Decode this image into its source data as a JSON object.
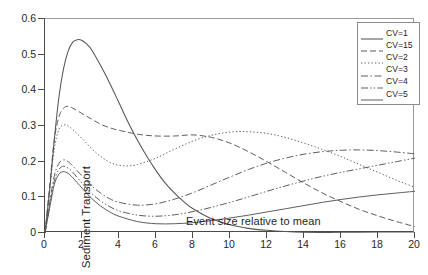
{
  "chart_data": {
    "type": "line",
    "title": "",
    "xlabel": "Event  size relative to mean",
    "ylabel": "Sediment Transport",
    "xlim": [
      0,
      20
    ],
    "ylim": [
      0,
      0.6
    ],
    "xticks": [
      0,
      2,
      4,
      6,
      8,
      10,
      12,
      14,
      16,
      18,
      20
    ],
    "yticks": [
      "0",
      "0.1",
      "0.2",
      "0.3",
      "0.4",
      "0.5",
      "0.6"
    ],
    "grid": false,
    "legend_position": "top-right",
    "series": [
      {
        "name": "CV=1",
        "style": "solid",
        "x": [
          0,
          0.25,
          0.5,
          0.75,
          1,
          1.25,
          1.5,
          1.75,
          2,
          2.25,
          2.5,
          3,
          3.5,
          4,
          4.5,
          5,
          5.5,
          6,
          6.5,
          7,
          7.5,
          8,
          9,
          10,
          11,
          12,
          13,
          14,
          16,
          18,
          20
        ],
        "y": [
          0,
          0.12,
          0.26,
          0.38,
          0.46,
          0.51,
          0.535,
          0.542,
          0.54,
          0.53,
          0.515,
          0.47,
          0.42,
          0.365,
          0.31,
          0.26,
          0.215,
          0.175,
          0.14,
          0.112,
          0.088,
          0.068,
          0.04,
          0.023,
          0.013,
          0.0075,
          0.004,
          0.0022,
          0.0007,
          0.0002,
          0.0001
        ]
      },
      {
        "name": "CV=15",
        "style": "dashed",
        "x": [
          0,
          0.25,
          0.5,
          0.75,
          1,
          1.25,
          1.5,
          2,
          2.5,
          3,
          3.5,
          4,
          5,
          6,
          7,
          8,
          9,
          10,
          11,
          12,
          13,
          14,
          15,
          16,
          17,
          18,
          19,
          20
        ],
        "y": [
          0,
          0.13,
          0.26,
          0.325,
          0.35,
          0.355,
          0.35,
          0.335,
          0.32,
          0.305,
          0.295,
          0.288,
          0.277,
          0.272,
          0.272,
          0.275,
          0.268,
          0.252,
          0.228,
          0.2,
          0.17,
          0.14,
          0.112,
          0.088,
          0.066,
          0.048,
          0.032,
          0.018
        ]
      },
      {
        "name": "CV=2",
        "style": "dotted",
        "x": [
          0,
          0.25,
          0.5,
          0.75,
          1,
          1.25,
          1.5,
          2,
          2.5,
          3,
          3.5,
          4,
          4.5,
          5,
          6,
          7,
          8,
          9,
          10,
          11,
          12,
          13,
          14,
          15,
          16,
          17,
          18,
          19,
          20
        ],
        "y": [
          0,
          0.12,
          0.235,
          0.29,
          0.303,
          0.3,
          0.29,
          0.265,
          0.238,
          0.215,
          0.198,
          0.19,
          0.188,
          0.192,
          0.21,
          0.235,
          0.258,
          0.274,
          0.283,
          0.284,
          0.279,
          0.268,
          0.252,
          0.234,
          0.214,
          0.192,
          0.17,
          0.148,
          0.128
        ]
      },
      {
        "name": "CV=3",
        "style": "dashdot",
        "x": [
          0,
          0.25,
          0.5,
          0.75,
          1,
          1.25,
          1.5,
          2,
          2.5,
          3,
          3.5,
          4,
          5,
          6,
          7,
          8,
          9,
          10,
          11,
          12,
          13,
          14,
          15,
          16,
          17,
          18,
          19,
          20
        ],
        "y": [
          0,
          0.085,
          0.16,
          0.195,
          0.205,
          0.2,
          0.188,
          0.16,
          0.133,
          0.112,
          0.096,
          0.086,
          0.078,
          0.082,
          0.095,
          0.113,
          0.135,
          0.157,
          0.178,
          0.196,
          0.21,
          0.221,
          0.228,
          0.232,
          0.233,
          0.231,
          0.227,
          0.222
        ]
      },
      {
        "name": "CV=4",
        "style": "dashdotdot",
        "x": [
          0,
          0.25,
          0.5,
          0.75,
          1,
          1.25,
          1.5,
          2,
          2.5,
          3,
          3.5,
          4,
          5,
          6,
          7,
          8,
          9,
          10,
          11,
          12,
          13,
          14,
          15,
          16,
          17,
          18,
          19,
          20
        ],
        "y": [
          0,
          0.075,
          0.145,
          0.178,
          0.187,
          0.182,
          0.17,
          0.14,
          0.112,
          0.09,
          0.074,
          0.062,
          0.05,
          0.047,
          0.051,
          0.06,
          0.072,
          0.086,
          0.101,
          0.117,
          0.132,
          0.146,
          0.159,
          0.17,
          0.18,
          0.19,
          0.2,
          0.21
        ]
      },
      {
        "name": "CV=5",
        "style": "solid-thin",
        "x": [
          0,
          0.25,
          0.5,
          0.75,
          1,
          1.25,
          1.5,
          2,
          2.5,
          3,
          3.5,
          4,
          5,
          6,
          7,
          8,
          9,
          10,
          11,
          12,
          13,
          14,
          15,
          16,
          17,
          18,
          19,
          20
        ],
        "y": [
          0,
          0.07,
          0.135,
          0.165,
          0.172,
          0.167,
          0.155,
          0.126,
          0.098,
          0.076,
          0.059,
          0.047,
          0.032,
          0.026,
          0.026,
          0.029,
          0.035,
          0.042,
          0.05,
          0.059,
          0.068,
          0.077,
          0.086,
          0.094,
          0.101,
          0.107,
          0.112,
          0.117
        ]
      }
    ]
  },
  "legend": {
    "items": [
      {
        "label": "CV=1"
      },
      {
        "label": "CV=15"
      },
      {
        "label": "CV=2"
      },
      {
        "label": "CV=3"
      },
      {
        "label": "CV=4"
      },
      {
        "label": "CV=5"
      }
    ]
  },
  "colors": {
    "axis": "#4a4a4a",
    "curve": "#555555",
    "text": "#1f1f1f",
    "background": "#ffffff"
  }
}
